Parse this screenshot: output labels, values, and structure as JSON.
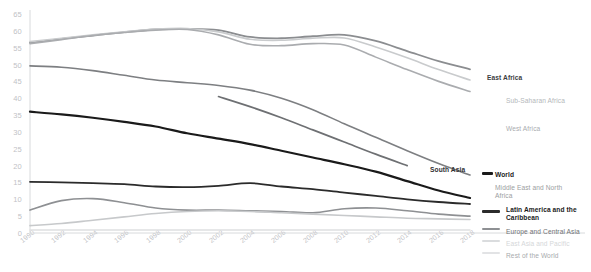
{
  "chart_data": {
    "type": "line",
    "title": "",
    "subtitle": "",
    "xlabel": "",
    "ylabel": "",
    "grid": false,
    "legend_position": "right-inline-labels",
    "xlim": [
      1990,
      2018
    ],
    "ylim": [
      0,
      65
    ],
    "yticks": [
      0,
      5,
      10,
      15,
      20,
      25,
      30,
      35,
      40,
      45,
      50,
      55,
      60,
      65
    ],
    "xticks": [
      1990,
      1992,
      1994,
      1996,
      1998,
      2000,
      2002,
      2004,
      2006,
      2008,
      2010,
      2012,
      2014,
      2016,
      2018
    ],
    "x": [
      1990,
      1992,
      1994,
      1996,
      1998,
      2000,
      2002,
      2004,
      2006,
      2008,
      2010,
      2012,
      2014,
      2016,
      2018
    ],
    "series": [
      {
        "name": "East Africa",
        "color": "#8b8d90",
        "width": 1.8,
        "label_bold": true,
        "label_color": "#3c3d3f",
        "x": [
          1990,
          1992,
          1994,
          1996,
          1998,
          2000,
          2002,
          2004,
          2006,
          2008,
          2010,
          2012,
          2014,
          2016,
          2018
        ],
        "values": [
          56.5,
          57.6,
          58.6,
          59.6,
          60.4,
          60.6,
          60.2,
          58.2,
          57.8,
          58.4,
          58.8,
          57.0,
          54.0,
          51.0,
          48.6
        ]
      },
      {
        "name": "Sub-Saharan Africa",
        "color": "#c9cbcd",
        "width": 1.6,
        "label_bold": false,
        "label_color": "#b4b7ba",
        "x": [
          1990,
          1992,
          1994,
          1996,
          1998,
          2000,
          2002,
          2004,
          2006,
          2008,
          2010,
          2012,
          2014,
          2016,
          2018
        ],
        "values": [
          56.8,
          57.8,
          58.8,
          59.7,
          60.5,
          60.7,
          59.7,
          57.5,
          57.2,
          57.8,
          57.9,
          55.2,
          52.0,
          48.5,
          45.4
        ]
      },
      {
        "name": "West Africa",
        "color": "#aaacaf",
        "width": 1.6,
        "label_bold": false,
        "label_color": "#a9acaf",
        "x": [
          1990,
          1992,
          1994,
          1996,
          1998,
          2000,
          2002,
          2004,
          2006,
          2008,
          2010,
          2012,
          2014,
          2016,
          2018
        ],
        "values": [
          56.2,
          57.4,
          58.6,
          59.5,
          60.2,
          60.4,
          58.8,
          56.0,
          55.6,
          56.2,
          55.8,
          52.2,
          48.5,
          45.0,
          42.0
        ]
      },
      {
        "name": "South Asia",
        "color": "#6e7073",
        "width": 1.7,
        "label_bold": true,
        "label_color": "#2f3032",
        "x": [
          2002,
          2004,
          2006,
          2008,
          2010,
          2012,
          2014
        ],
        "values": [
          40.5,
          37.5,
          34.2,
          30.6,
          27.0,
          23.4,
          20.0
        ]
      },
      {
        "name": "Middle East and North Africa",
        "color": "#7d7f82",
        "width": 1.6,
        "label_bold": false,
        "label_color": "#9b9ea1",
        "x": [
          1990,
          1992,
          1994,
          1996,
          1998,
          2000,
          2002,
          2004,
          2006,
          2008,
          2010,
          2012,
          2014,
          2016,
          2018
        ],
        "values": [
          49.6,
          49.2,
          48.2,
          46.8,
          45.4,
          44.6,
          43.8,
          42.4,
          40.0,
          36.6,
          32.4,
          28.4,
          24.4,
          20.6,
          17.2
        ]
      },
      {
        "name": "World",
        "color": "#1a1a1a",
        "width": 2.2,
        "label_bold": true,
        "label_color": "#1a1a1a",
        "x": [
          1990,
          1992,
          1994,
          1996,
          1998,
          2000,
          2002,
          2004,
          2006,
          2008,
          2010,
          2012,
          2014,
          2016,
          2018
        ],
        "values": [
          36.0,
          35.2,
          34.2,
          33.0,
          31.6,
          29.6,
          28.0,
          26.4,
          24.4,
          22.4,
          20.4,
          18.2,
          15.4,
          12.6,
          10.4
        ]
      },
      {
        "name": "Latin America and the Caribbean",
        "color": "#2b2b2b",
        "width": 1.8,
        "label_bold": true,
        "label_color": "#1a1a1a",
        "x": [
          1990,
          1992,
          1994,
          1996,
          1998,
          2000,
          2002,
          2004,
          2006,
          2008,
          2010,
          2012,
          2014,
          2016,
          2018
        ],
        "values": [
          15.2,
          15.0,
          14.8,
          14.5,
          13.8,
          13.6,
          14.0,
          14.8,
          13.8,
          13.0,
          12.0,
          11.0,
          10.0,
          9.2,
          8.6
        ]
      },
      {
        "name": "Europe and Central Asia",
        "color": "#8e9093",
        "width": 1.6,
        "label_bold": false,
        "label_color": "#6f7275",
        "x": [
          1990,
          1992,
          1994,
          1996,
          1998,
          2000,
          2002,
          2004,
          2006,
          2008,
          2010,
          2012,
          2014,
          2016,
          2018
        ],
        "values": [
          6.8,
          9.6,
          10.2,
          9.0,
          7.4,
          6.8,
          6.8,
          6.6,
          6.4,
          6.0,
          7.2,
          7.4,
          6.6,
          5.6,
          5.0
        ]
      },
      {
        "name": "East Asia and Pacific",
        "color": "#c7c9cb",
        "width": 1.6,
        "label_bold": false,
        "label_color": "#d5d7d9",
        "x": [
          1990,
          1992,
          1994,
          1996,
          1998,
          2000,
          2002,
          2004,
          2006,
          2008,
          2010,
          2012,
          2014,
          2016,
          2018
        ],
        "values": [
          2.2,
          2.8,
          3.8,
          4.8,
          5.8,
          6.4,
          6.6,
          6.4,
          6.0,
          5.6,
          5.2,
          4.8,
          4.4,
          4.2,
          4.0
        ]
      },
      {
        "name": "Rest of the World",
        "color": "#dedfe1",
        "width": 1.4,
        "label_bold": false,
        "label_color": "#a7aaad",
        "x": [
          1990,
          1992,
          1994,
          1996,
          1998,
          2000,
          2002,
          2004,
          2006,
          2008,
          2010,
          2012,
          2014,
          2016,
          2018
        ],
        "values": [
          0.9,
          0.9,
          0.9,
          0.9,
          0.9,
          0.9,
          0.9,
          0.9,
          0.9,
          0.9,
          0.9,
          0.9,
          0.9,
          0.9,
          0.9
        ]
      }
    ],
    "inline_labels": [
      {
        "text": "East Africa",
        "x": 487,
        "y": 74,
        "bold": true,
        "color": "#3c3d3f"
      },
      {
        "text": "Sub-Saharan Africa",
        "x": 506,
        "y": 97,
        "bold": false,
        "color": "#b4b7ba"
      },
      {
        "text": "West Africa",
        "x": 506,
        "y": 125,
        "bold": false,
        "color": "#a9acaf"
      },
      {
        "text": "South Asia",
        "x": 430,
        "y": 166,
        "bold": true,
        "color": "#2f3032"
      },
      {
        "text": "World",
        "x": 495,
        "y": 171,
        "bold": true,
        "color": "#1a1a1a"
      },
      {
        "text": "Middle East and North",
        "x": 495,
        "y": 184,
        "bold": false,
        "color": "#9b9ea1"
      },
      {
        "text": "Africa",
        "x": 495,
        "y": 192,
        "bold": false,
        "color": "#9b9ea1"
      },
      {
        "text": "Latin America and the",
        "x": 506,
        "y": 206,
        "bold": true,
        "color": "#1a1a1a"
      },
      {
        "text": "Caribbean",
        "x": 506,
        "y": 214,
        "bold": true,
        "color": "#1a1a1a"
      },
      {
        "text": "Europe and Central Asia",
        "x": 506,
        "y": 228,
        "bold": false,
        "color": "#6f7275"
      },
      {
        "text": "East Asia and Pacific",
        "x": 506,
        "y": 240,
        "bold": false,
        "color": "#d5d7d9"
      },
      {
        "text": "Rest of the World",
        "x": 506,
        "y": 252,
        "bold": false,
        "color": "#a7aaad"
      }
    ],
    "legend_markers": [
      {
        "name": "world",
        "x": 482,
        "y": 172,
        "w": 11,
        "color": "#1a1a1a",
        "h": 2.6
      },
      {
        "name": "latin-america",
        "x": 482,
        "y": 210,
        "w": 18,
        "color": "#2b2b2b",
        "h": 2.6
      },
      {
        "name": "europe-central-asia",
        "x": 482,
        "y": 228,
        "w": 18,
        "color": "#8e9093",
        "h": 2.4
      },
      {
        "name": "east-asia-pacific",
        "x": 482,
        "y": 240,
        "w": 18,
        "color": "#dadcde",
        "h": 2.0
      },
      {
        "name": "rest-of-world",
        "x": 482,
        "y": 252,
        "w": 18,
        "color": "#e2e3e5",
        "h": 1.8
      }
    ]
  },
  "axes": {
    "y_tick_labels": [
      "65",
      "60",
      "55",
      "50",
      "45",
      "40",
      "35",
      "30",
      "25",
      "20",
      "15",
      "10",
      "5",
      "0"
    ],
    "x_tick_labels": [
      "1990",
      "1992",
      "1994",
      "1996",
      "1998",
      "2000",
      "2002",
      "2004",
      "2006",
      "2008",
      "2010",
      "2012",
      "2014",
      "2016",
      "2018"
    ],
    "axis_color": "#d8dadc",
    "tick_text_color": "#bfc2c6"
  }
}
